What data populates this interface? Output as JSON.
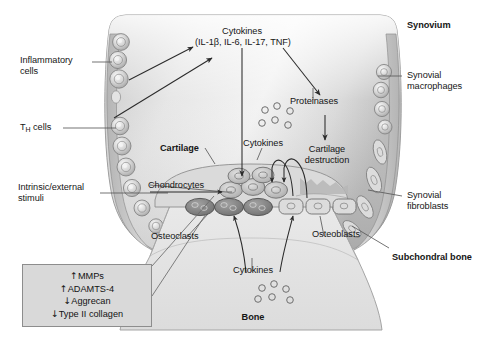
{
  "figure": {
    "background_color": "#ffffff"
  },
  "palette": {
    "capsule_fill": "#d2d2d2",
    "capsule_light": "#ececec",
    "capsule_edge": "#8a8a8a",
    "bone_fill": "#e3e3e3",
    "bone_edge": "#9a9a9a",
    "cartilage_fill": "#dcdcdc",
    "osteoclast_fill": "#8f8f8f",
    "chondrocyte_fill": "#b9b9b9",
    "osteoblast_fill": "#d7d7d7",
    "cell_ring": "#7d7d7d",
    "line_color": "#2b2b2b",
    "leader_color": "#555555",
    "box_fill": "#d9d9d9",
    "box_border": "#8d8d8d",
    "text_color": "#161616"
  },
  "labels": {
    "inflammatory_cells": "Inflammatory\ncells",
    "th_cells_prefix": "T",
    "th_cells_sub": "H",
    "th_cells_suffix": " cells",
    "intrinsic_stimuli": "Intrinsic/external\nstimuli",
    "cytokines_top": "Cytokines",
    "cytokines_top_list": "(IL-1β, IL-6, IL-17, TNF)",
    "synovium": "Synovium",
    "synovial_macrophages": "Synovial\nmacrophages",
    "proteinases": "Proteinases",
    "cartilage_destruction": "Cartilage\ndestruction",
    "synovial_fibroblasts": "Synovial\nfibroblasts",
    "cartilage": "Cartilage",
    "cytokines_mid": "Cytokines",
    "chondrocytes": "Chondrocytes",
    "osteoclasts": "Osteoclasts",
    "osteoblasts": "Osteoblasts",
    "subchondral_bone": "Subchondral bone",
    "cytokines_bone": "Cytokines",
    "bone": "Bone"
  },
  "mediator_box": {
    "items": [
      {
        "direction": "up",
        "arrow": "↑",
        "name": "MMPs"
      },
      {
        "direction": "up",
        "arrow": "↑",
        "name": "ADAMTS-4"
      },
      {
        "direction": "down",
        "arrow": "↓",
        "name": "Aggrecan"
      },
      {
        "direction": "down",
        "arrow": "↓",
        "name": "Type II collagen"
      }
    ]
  },
  "cell_types": [
    {
      "name": "Inflammatory cells",
      "shape": "round-concentric",
      "location": "left synovial lining"
    },
    {
      "name": "T helper cells",
      "shape": "round-concentric",
      "location": "left synovial lining, lower"
    },
    {
      "name": "Synovial macrophages",
      "shape": "round-concentric",
      "location": "right synovial lining, upper"
    },
    {
      "name": "Synovial fibroblasts",
      "shape": "spindle",
      "location": "right synovial lining, lower"
    },
    {
      "name": "Chondrocytes",
      "shape": "oval",
      "location": "cartilage layer"
    },
    {
      "name": "Osteoclasts",
      "shape": "dark-oval",
      "location": "bone surface, left of centre"
    },
    {
      "name": "Osteoblasts",
      "shape": "cuboidal",
      "location": "bone surface, right of centre"
    }
  ],
  "flows": [
    {
      "from": "Inflammatory cells",
      "to": "Cytokines (top)",
      "style": "straight-arrow"
    },
    {
      "from": "T helper cells",
      "to": "Cytokines (top)",
      "style": "straight-arrow"
    },
    {
      "from": "Cytokines (top)",
      "to": "Chondrocytes",
      "style": "straight-arrow-down"
    },
    {
      "from": "Cytokines (top)",
      "to": "Proteinases",
      "style": "straight-arrow-diagonal"
    },
    {
      "from": "Proteinases",
      "to": "Cartilage destruction",
      "style": "straight-arrow-down"
    },
    {
      "from": "Chondrocytes",
      "to": "Cytokines (mid)",
      "style": "curved-arch"
    },
    {
      "from": "Osteoclasts",
      "to": "Cytokines (bone)",
      "style": "curved-arch-down"
    },
    {
      "from": "Osteoblasts",
      "to": "Cytokines (bone)",
      "style": "curved-arch-down"
    },
    {
      "from": "Intrinsic/external stimuli",
      "to": "Chondrocytes",
      "style": "leader-arrow"
    }
  ]
}
